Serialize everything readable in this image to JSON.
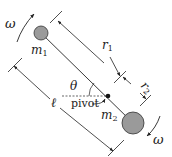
{
  "diagram": {
    "labels": {
      "omega_top": "ω",
      "omega_bottom": "ω",
      "m1": "m",
      "m1_sub": "1",
      "m2": "m",
      "m2_sub": "2",
      "r1": "r",
      "r1_sub": "1",
      "r2": "r",
      "r2_sub": "2",
      "ell": "ℓ",
      "theta": "θ",
      "pivot": "pivot"
    },
    "colors": {
      "ink": "#222222",
      "mass_fill": "#9a9a9a",
      "mass_stroke": "#333333"
    }
  }
}
